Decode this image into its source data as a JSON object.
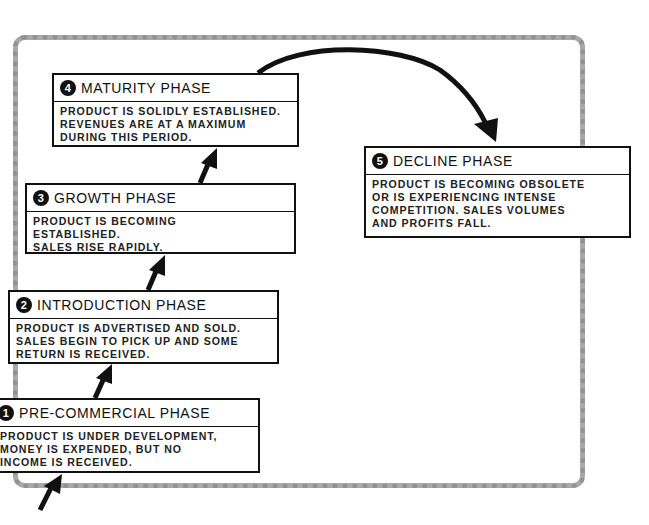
{
  "diagram": {
    "phases": [
      {
        "number": "1",
        "title": "PRE-COMMERCIAL PHASE",
        "lines": [
          "PRODUCT IS UNDER DEVELOPMENT,",
          "MONEY IS EXPENDED, BUT NO",
          "INCOME IS RECEIVED."
        ]
      },
      {
        "number": "2",
        "title": "INTRODUCTION PHASE",
        "lines": [
          "PRODUCT IS ADVERTISED AND SOLD.",
          "SALES BEGIN TO PICK UP AND SOME",
          "RETURN IS RECEIVED."
        ]
      },
      {
        "number": "3",
        "title": "GROWTH PHASE",
        "lines": [
          "PRODUCT IS BECOMING",
          "ESTABLISHED.",
          "SALES RISE RAPIDLY."
        ]
      },
      {
        "number": "4",
        "title": "MATURITY PHASE",
        "lines": [
          "PRODUCT IS SOLIDLY ESTABLISHED.",
          "REVENUES ARE AT A MAXIMUM",
          "DURING THIS PERIOD."
        ]
      },
      {
        "number": "5",
        "title": "DECLINE PHASE",
        "lines": [
          "PRODUCT IS BECOMING OBSOLETE",
          "OR IS EXPERIENCING INTENSE",
          "COMPETITION. SALES VOLUMES",
          "AND PROFITS FALL."
        ]
      }
    ],
    "colors": {
      "ink": "#111111",
      "frame": "#a9a9a9",
      "background": "#ffffff"
    }
  }
}
